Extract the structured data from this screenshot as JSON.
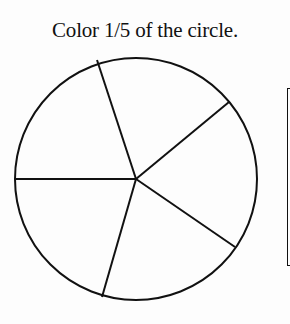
{
  "worksheet": {
    "instruction": "Color 1/5 of the circle.",
    "fraction": "1/5",
    "shape": "circle",
    "total_parts": 5,
    "parts_to_color": 1
  },
  "colors": {
    "stroke": "#111111",
    "background": "#fdfdfd"
  }
}
